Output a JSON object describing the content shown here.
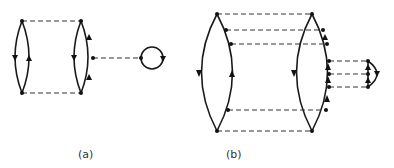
{
  "figure": {
    "panels": [
      {
        "id": "a",
        "label": "(a)",
        "description": "Two fermion loops connected by two dashed interaction lines, with the second loop connected via a dashed line to a tadpole bubble"
      },
      {
        "id": "b",
        "label": "(b)",
        "description": "Two fermion loops connected by four dashed lines; right loop connected by three dashed lines to a small closed loop"
      }
    ]
  }
}
